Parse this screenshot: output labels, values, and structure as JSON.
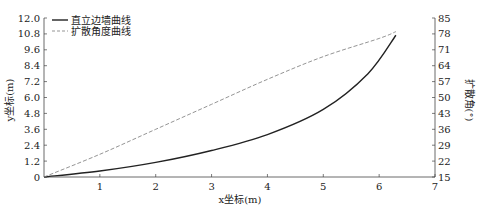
{
  "chart_data": {
    "type": "line",
    "title": "",
    "xlabel": "x坐标(m)",
    "ylabel": "y坐标(m)",
    "y2label": "扩散角(°)",
    "xlim": [
      0,
      7
    ],
    "ylim": [
      0,
      12.0
    ],
    "y2lim": [
      15,
      85
    ],
    "x_ticks": [
      "1",
      "2",
      "3",
      "4",
      "5",
      "6",
      "7"
    ],
    "y_ticks": [
      "0",
      "1.2",
      "2.4",
      "3.6",
      "4.8",
      "6.0",
      "7.2",
      "8.4",
      "9.6",
      "10.8",
      "12.0"
    ],
    "y2_ticks": [
      "15",
      "22",
      "29",
      "36",
      "43",
      "50",
      "57",
      "64",
      "71",
      "78",
      "85"
    ],
    "grid": false,
    "legend_position": "top-left",
    "series": [
      {
        "name": "直立边墙曲线",
        "axis": "left",
        "style": "solid",
        "color": "#222222",
        "x": [
          0,
          1,
          2,
          3,
          4,
          5,
          5.8,
          6.3
        ],
        "values": [
          0,
          0.45,
          1.1,
          2.0,
          3.2,
          5.1,
          7.8,
          10.7
        ]
      },
      {
        "name": "扩散角度曲线",
        "axis": "right",
        "style": "dashed",
        "color": "#888888",
        "x": [
          0,
          1,
          2,
          3,
          4,
          5,
          6,
          6.3
        ],
        "values": [
          15,
          25,
          36,
          47,
          58,
          68,
          76,
          79
        ]
      }
    ]
  }
}
